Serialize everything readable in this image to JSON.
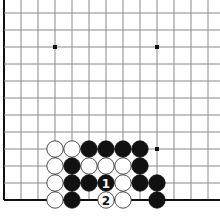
{
  "board": {
    "size": 19,
    "view": {
      "cols_visible": 13,
      "rows_visible": 12,
      "origin_x": 4,
      "origin_y": 200,
      "spacing": 17
    },
    "edges": {
      "left": true,
      "bottom": true,
      "top": false,
      "right": false
    },
    "colors": {
      "grid": "#8a8a8a",
      "edge": "#111111",
      "black_stone": "#111111",
      "white_stone": "#ffffff",
      "white_outline": "#222222",
      "star": "#111111"
    },
    "star_points": [
      {
        "col": 3,
        "row": 9
      },
      {
        "col": 9,
        "row": 9
      },
      {
        "col": 9,
        "row": 3
      }
    ],
    "stones": [
      {
        "col": 3,
        "row": 3,
        "color": "white"
      },
      {
        "col": 4,
        "row": 3,
        "color": "white"
      },
      {
        "col": 5,
        "row": 3,
        "color": "black"
      },
      {
        "col": 6,
        "row": 3,
        "color": "black"
      },
      {
        "col": 7,
        "row": 3,
        "color": "black"
      },
      {
        "col": 8,
        "row": 3,
        "color": "black"
      },
      {
        "col": 3,
        "row": 2,
        "color": "white"
      },
      {
        "col": 4,
        "row": 2,
        "color": "black"
      },
      {
        "col": 5,
        "row": 2,
        "color": "white"
      },
      {
        "col": 6,
        "row": 2,
        "color": "white"
      },
      {
        "col": 7,
        "row": 2,
        "color": "white"
      },
      {
        "col": 8,
        "row": 2,
        "color": "black"
      },
      {
        "col": 3,
        "row": 1,
        "color": "white"
      },
      {
        "col": 4,
        "row": 1,
        "color": "black"
      },
      {
        "col": 5,
        "row": 1,
        "color": "black"
      },
      {
        "col": 6,
        "row": 1,
        "color": "black",
        "label": "1"
      },
      {
        "col": 7,
        "row": 1,
        "color": "white"
      },
      {
        "col": 8,
        "row": 1,
        "color": "black"
      },
      {
        "col": 9,
        "row": 1,
        "color": "black"
      },
      {
        "col": 3,
        "row": 0,
        "color": "white"
      },
      {
        "col": 4,
        "row": 0,
        "color": "black"
      },
      {
        "col": 6,
        "row": 0,
        "color": "white",
        "label": "2"
      },
      {
        "col": 7,
        "row": 0,
        "color": "white"
      },
      {
        "col": 9,
        "row": 0,
        "color": "black"
      }
    ]
  }
}
